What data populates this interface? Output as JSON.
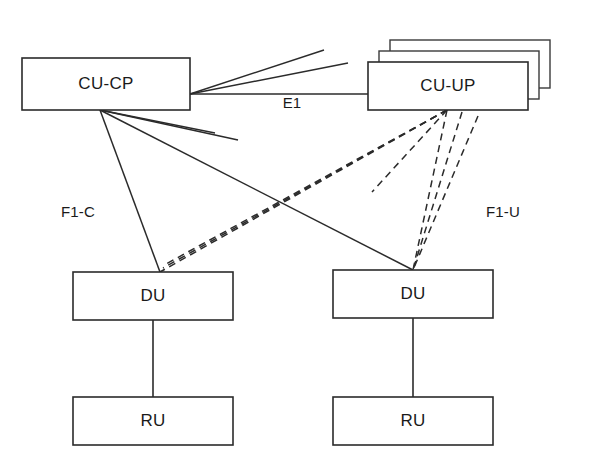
{
  "diagram": {
    "background_color": "#ffffff",
    "line_color": "#2b2b2b",
    "canvas": {
      "width": 599,
      "height": 471
    },
    "nodes": [
      {
        "id": "cu-cp",
        "label": "CU-CP",
        "x": 22,
        "y": 58,
        "w": 168,
        "h": 52,
        "stacked": false,
        "stack_count": 1
      },
      {
        "id": "cu-up",
        "label": "CU-UP",
        "x": 368,
        "y": 62,
        "w": 160,
        "h": 48,
        "stacked": true,
        "stack_count": 3,
        "stack_offset": 11
      },
      {
        "id": "du-left",
        "label": "DU",
        "x": 73,
        "y": 272,
        "w": 160,
        "h": 48,
        "stacked": false,
        "stack_count": 1
      },
      {
        "id": "du-right",
        "label": "DU",
        "x": 333,
        "y": 270,
        "w": 160,
        "h": 48,
        "stacked": false,
        "stack_count": 1
      },
      {
        "id": "ru-left",
        "label": "RU",
        "x": 73,
        "y": 397,
        "w": 160,
        "h": 48,
        "stacked": false,
        "stack_count": 1
      },
      {
        "id": "ru-right",
        "label": "RU",
        "x": 333,
        "y": 397,
        "w": 160,
        "h": 48,
        "stacked": false,
        "stack_count": 1
      }
    ],
    "edge_labels": [
      {
        "id": "e1",
        "text": "E1",
        "x": 292,
        "y": 104
      },
      {
        "id": "f1-c",
        "text": "F1-C",
        "x": 78,
        "y": 213
      },
      {
        "id": "f1-u",
        "text": "F1-U",
        "x": 503,
        "y": 213
      }
    ],
    "links_solid_e1": [
      {
        "id": "e1-front",
        "x1": 190,
        "y1": 94,
        "x2": 368,
        "y2": 94
      },
      {
        "id": "e1-stack2",
        "x1": 190,
        "y1": 94,
        "x2": 348,
        "y2": 63
      },
      {
        "id": "e1-stack3",
        "x1": 190,
        "y1": 94,
        "x2": 324,
        "y2": 50
      }
    ],
    "links_solid_f1c": [
      {
        "id": "f1c-du-left",
        "x1": 100,
        "y1": 110,
        "x2": 160,
        "y2": 272
      },
      {
        "id": "f1c-du-right",
        "x1": 100,
        "y1": 110,
        "x2": 413,
        "y2": 270
      },
      {
        "id": "f1c-stub-a",
        "x1": 100,
        "y1": 110,
        "x2": 238,
        "y2": 140
      },
      {
        "id": "f1c-stub-b",
        "x1": 100,
        "y1": 110,
        "x2": 215,
        "y2": 133
      }
    ],
    "links_dashed_f1u": [
      {
        "id": "f1u-left-a",
        "x1": 447,
        "y1": 110,
        "x2": 160,
        "y2": 272
      },
      {
        "id": "f1u-left-b",
        "x1": 447,
        "y1": 110,
        "x2": 163,
        "y2": 268
      },
      {
        "id": "f1u-left-c",
        "x1": 447,
        "y1": 110,
        "x2": 166,
        "y2": 264
      },
      {
        "id": "f1u-stub",
        "x1": 447,
        "y1": 110,
        "x2": 372,
        "y2": 192
      },
      {
        "id": "f1u-right-a",
        "x1": 447,
        "y1": 110,
        "x2": 413,
        "y2": 270
      },
      {
        "id": "f1u-right-b",
        "x1": 462,
        "y1": 112,
        "x2": 413,
        "y2": 270
      },
      {
        "id": "f1u-right-c",
        "x1": 478,
        "y1": 116,
        "x2": 413,
        "y2": 270
      }
    ],
    "links_vertical": [
      {
        "id": "du-ru-left",
        "x1": 153,
        "y1": 320,
        "x2": 153,
        "y2": 397
      },
      {
        "id": "du-ru-right",
        "x1": 413,
        "y1": 318,
        "x2": 413,
        "y2": 397
      }
    ]
  }
}
